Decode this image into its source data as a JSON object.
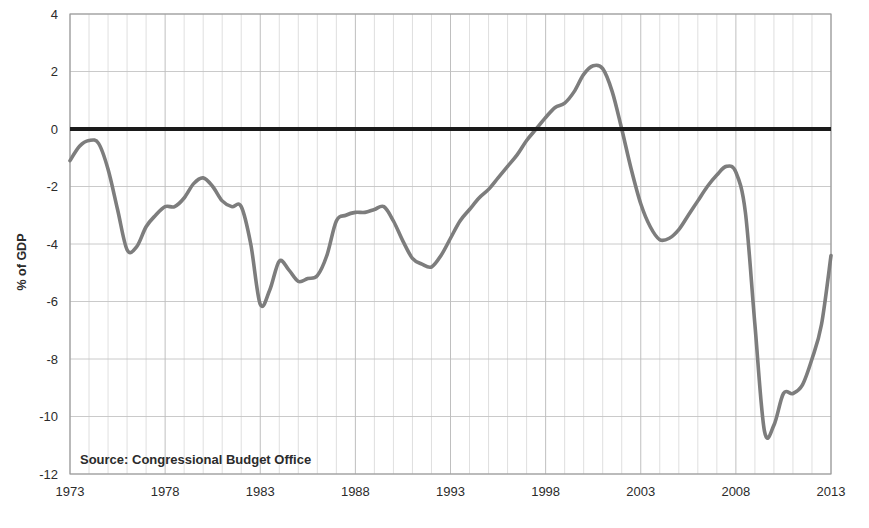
{
  "chart_data": {
    "type": "line",
    "title": "",
    "subtitle": "",
    "xlabel": "",
    "ylabel": "% of GDP",
    "xlim": [
      1973,
      2013
    ],
    "ylim": [
      -12,
      4
    ],
    "grid": true,
    "legend": "none",
    "source_note": "Source: Congressional Budget Office",
    "series_color": "#7d7d7d",
    "zero_line_color": "#1a1a1a",
    "grid_color": "#d7d7d7",
    "background_color": "#ffffff",
    "xticks": [
      1973,
      1978,
      1983,
      1988,
      1993,
      1998,
      2003,
      2008,
      2013
    ],
    "xtick_labels": [
      "1973",
      "1978",
      "1983",
      "1988",
      "1993",
      "1998",
      "2003",
      "2008",
      "2013"
    ],
    "yticks": [
      4,
      2,
      0,
      -2,
      -4,
      -6,
      -8,
      -10,
      -12
    ],
    "ytick_labels": [
      "4",
      "2",
      "0",
      "-2",
      "-4",
      "-6",
      "-8",
      "-10",
      "-12"
    ],
    "x": [
      1973,
      1973.5,
      1974,
      1974.5,
      1975,
      1975.5,
      1976,
      1976.5,
      1977,
      1977.5,
      1978,
      1978.5,
      1979,
      1979.5,
      1980,
      1980.5,
      1981,
      1981.5,
      1982,
      1982.5,
      1983,
      1983.5,
      1984,
      1984.5,
      1985,
      1985.5,
      1986,
      1986.5,
      1987,
      1987.5,
      1988,
      1988.5,
      1989,
      1989.5,
      1990,
      1990.5,
      1991,
      1991.5,
      1992,
      1992.5,
      1993,
      1993.5,
      1994,
      1994.5,
      1995,
      1995.5,
      1996,
      1996.5,
      1997,
      1997.5,
      1998,
      1998.5,
      1999,
      1999.5,
      2000,
      2000.5,
      2001,
      2001.5,
      2002,
      2002.5,
      2003,
      2003.5,
      2004,
      2004.5,
      2005,
      2005.5,
      2006,
      2006.5,
      2007,
      2007.5,
      2008,
      2008.5,
      2009,
      2009.5,
      2010,
      2010.5,
      2011,
      2011.5,
      2012,
      2012.5,
      2013
    ],
    "values": [
      -1.1,
      -0.6,
      -0.4,
      -0.5,
      -1.4,
      -2.8,
      -4.2,
      -4.1,
      -3.4,
      -3.0,
      -2.7,
      -2.7,
      -2.4,
      -1.9,
      -1.7,
      -2.0,
      -2.5,
      -2.7,
      -2.7,
      -4.0,
      -6.1,
      -5.6,
      -4.6,
      -4.9,
      -5.3,
      -5.2,
      -5.1,
      -4.4,
      -3.2,
      -3.0,
      -2.9,
      -2.9,
      -2.8,
      -2.7,
      -3.2,
      -3.9,
      -4.5,
      -4.7,
      -4.8,
      -4.4,
      -3.8,
      -3.2,
      -2.8,
      -2.4,
      -2.1,
      -1.7,
      -1.3,
      -0.9,
      -0.4,
      0.0,
      0.4,
      0.75,
      0.9,
      1.3,
      1.9,
      2.2,
      2.1,
      1.3,
      0.0,
      -1.4,
      -2.6,
      -3.4,
      -3.85,
      -3.8,
      -3.5,
      -3.0,
      -2.5,
      -2.0,
      -1.6,
      -1.3,
      -1.5,
      -2.9,
      -6.8,
      -10.5,
      -10.3,
      -9.2,
      -9.2,
      -8.9,
      -8.0,
      -6.8,
      -4.4
    ]
  },
  "axis": {
    "y_title": "% of GDP"
  }
}
